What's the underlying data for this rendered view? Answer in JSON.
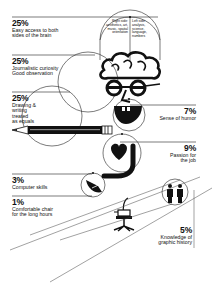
{
  "infographic": {
    "brain_hemispheres": {
      "right": "Right side: aesthetics, art, music, spatial orientation",
      "left": "Left side: analysis, science, language, numbers"
    },
    "items": [
      {
        "percent": "25%",
        "line1": "Easy access to both",
        "line2": "sides of the brain",
        "icon": "brain-icon"
      },
      {
        "percent": "25%",
        "line1": "Journalistic curiosity",
        "line2": "Good observation",
        "icon": "glasses-icon"
      },
      {
        "percent": "25%",
        "line1": "Drawing &",
        "line2": "writing",
        "line3": "treated",
        "line4": "as equals",
        "icon": "pencil-icon"
      },
      {
        "percent": "7%",
        "line1": "Sense of humor",
        "icon": "smile-icon"
      },
      {
        "percent": "9%",
        "line1": "Passion for",
        "line2": "the job",
        "icon": "heart-icon"
      },
      {
        "percent": "3%",
        "line1": "Computer skills",
        "icon": "mouse-icon"
      },
      {
        "percent": "1%",
        "line1": "Comfortable chair",
        "line2": "for the long hours",
        "icon": "chair-icon"
      },
      {
        "percent": "5%",
        "line1": "Knowledge of",
        "line2": "graphic history",
        "icon": "figures-icon"
      }
    ]
  }
}
